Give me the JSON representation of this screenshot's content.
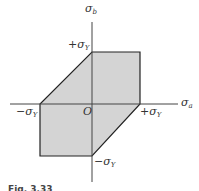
{
  "diagram": {
    "axes": {
      "horizontal": {
        "symbol": "σ",
        "subscript": "a"
      },
      "vertical": {
        "symbol": "σ",
        "subscript": "b"
      }
    },
    "origin_label": "O",
    "labels": {
      "pos_y_vertical": {
        "prefix": "+σ",
        "subscript": "Y"
      },
      "neg_y_horizontal": {
        "prefix": "−σ",
        "subscript": "Y"
      },
      "pos_y_horizontal": {
        "prefix": "+σ",
        "subscript": "Y"
      },
      "neg_y_vertical": {
        "prefix": "−σ",
        "subscript": "Y"
      }
    },
    "region": {
      "fill": "#d4d4d4",
      "stroke": "#222222",
      "vertices": [
        [
          0,
          1
        ],
        [
          1,
          1
        ],
        [
          1,
          0
        ],
        [
          0,
          -1
        ],
        [
          -1,
          -1
        ],
        [
          -1,
          0
        ]
      ]
    },
    "caption": "Fig. 3.33"
  }
}
